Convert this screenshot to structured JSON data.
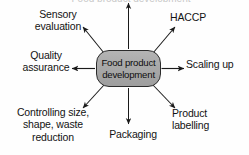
{
  "diagram": {
    "type": "radial-hub-and-spoke",
    "title_cutoff": "Food product development",
    "center": {
      "line1": "Food product",
      "line2": "development",
      "fill_color": "#a9a9a9",
      "border_color": "#2b2b2b",
      "shape": "rounded-rectangle"
    },
    "background_color": "#fefefe",
    "arrow_color": "#1a1a1a",
    "text_color": "#131313",
    "spokes": [
      {
        "id": "up",
        "label": "",
        "direction": "up",
        "arrowhead": "outward"
      },
      {
        "id": "up-left",
        "label": "Sensory\nevaluation",
        "direction": "up-left",
        "arrowhead": "outward"
      },
      {
        "id": "up-right",
        "label": "HACCP",
        "direction": "up-right",
        "arrowhead": "outward"
      },
      {
        "id": "left",
        "label": "Quality\nassurance",
        "direction": "left",
        "arrowhead": "outward"
      },
      {
        "id": "right",
        "label": "Scaling up",
        "direction": "right",
        "arrowhead": "outward"
      },
      {
        "id": "down-left",
        "label": "Controlling size,\nshape, waste\nreduction",
        "direction": "down-left",
        "arrowhead": "outward"
      },
      {
        "id": "down",
        "label": "Packaging",
        "direction": "down",
        "arrowhead": "outward"
      },
      {
        "id": "down-right",
        "label": "Product\nlabelling",
        "direction": "down-right",
        "arrowhead": "outward"
      }
    ]
  }
}
